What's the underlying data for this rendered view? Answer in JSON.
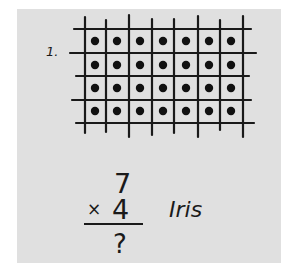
{
  "worksheet": {
    "problem_number_label": "1.",
    "array": {
      "rows": 4,
      "columns": 7,
      "dot_color": "#111111",
      "grid_color": "#1a1a1a"
    },
    "equation": {
      "top": "7",
      "operator": "×",
      "bottom": "4",
      "answer": "?"
    },
    "student_name": "Iris"
  },
  "colors": {
    "background": "#ffffff",
    "panel": "#e0e0e0",
    "ink": "#1a1a1a"
  }
}
